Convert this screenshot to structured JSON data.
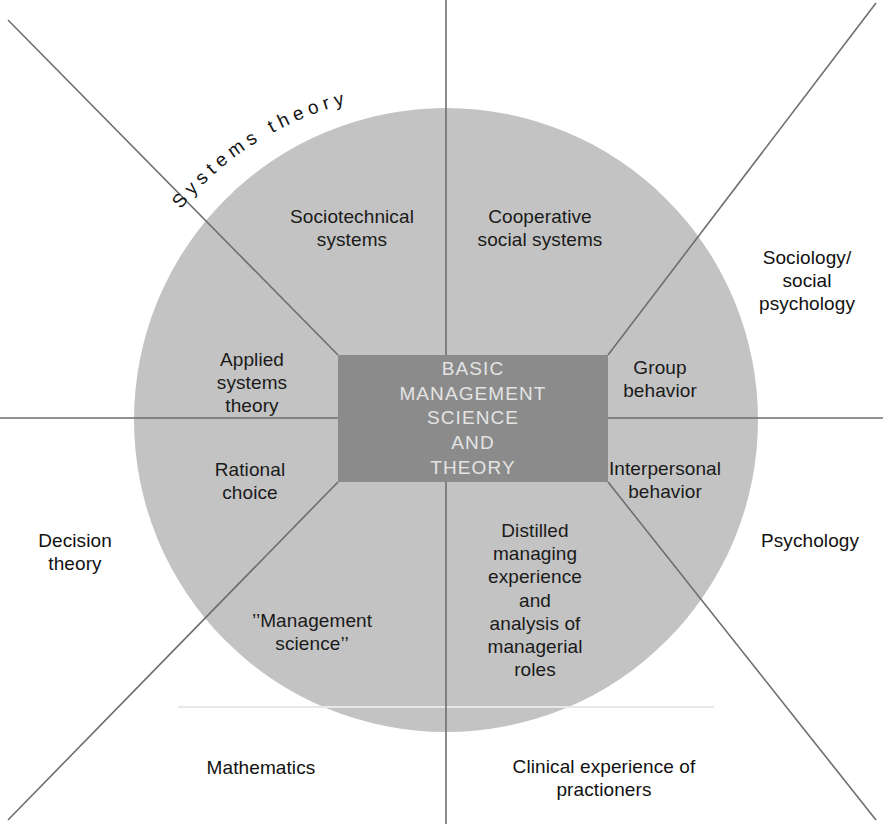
{
  "diagram": {
    "title_center": "BASIC\nMANAGEMENT\nSCIENCE\nAND\nTHEORY",
    "colors": {
      "circle_fill": "#c3c3c3",
      "center_box_fill": "#8b8b8b",
      "center_text": "#e4e4e4",
      "line": "#6e6e6e",
      "label_text": "#1a1a1a",
      "background": "#ffffff"
    },
    "geometry": {
      "center_x": 446,
      "center_y": 420,
      "radius": 312,
      "box_left": 338,
      "box_top": 355,
      "box_right": 608,
      "box_bottom": 482
    },
    "arc_labels": [
      {
        "name": "systems-theory-arc",
        "text": "Systems theory"
      }
    ],
    "inner_sectors": [
      {
        "id": "sociotechnical-systems",
        "label": "Sociotechnical\nsystems",
        "x": 352,
        "y": 228
      },
      {
        "id": "cooperative-social-systems",
        "label": "Cooperative\nsocial systems",
        "x": 540,
        "y": 228
      },
      {
        "id": "applied-systems-theory",
        "label": "Applied\nsystems\ntheory",
        "x": 252,
        "y": 383
      },
      {
        "id": "group-behavior",
        "label": "Group\nbehavior",
        "x": 660,
        "y": 379
      },
      {
        "id": "rational-choice",
        "label": "Rational\nchoice",
        "x": 250,
        "y": 481
      },
      {
        "id": "interpersonal-behavior",
        "label": "Interpersonal\nbehavior",
        "x": 665,
        "y": 480
      },
      {
        "id": "management-science",
        "label": "’’Management\nscience’’",
        "x": 312,
        "y": 632
      },
      {
        "id": "distilled-managing-experience",
        "label": "Distilled\nmanaging\nexperience\nand\nanalysis of\nmanagerial\nroles",
        "x": 535,
        "y": 600
      }
    ],
    "outer_labels": [
      {
        "id": "sociology-social-psychology",
        "label": "Sociology/\nsocial\npsychology",
        "x": 807,
        "y": 281
      },
      {
        "id": "psychology",
        "label": "Psychology",
        "x": 810,
        "y": 541
      },
      {
        "id": "decision-theory",
        "label": "Decision\ntheory",
        "x": 75,
        "y": 552
      },
      {
        "id": "mathematics",
        "label": "Mathematics",
        "x": 261,
        "y": 768
      },
      {
        "id": "clinical-experience-of-practioners",
        "label": "Clinical experience of\npractioners",
        "x": 604,
        "y": 778
      }
    ]
  }
}
